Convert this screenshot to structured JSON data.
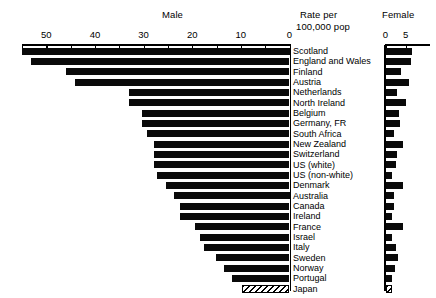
{
  "header": {
    "male_title": "Male",
    "rate_line1": "Rate per",
    "rate_line2": "100,000 pop",
    "female_title": "Female"
  },
  "axes": {
    "male": {
      "ticks": [
        55,
        50,
        45,
        40,
        35,
        30,
        25,
        20,
        15,
        10,
        5,
        0
      ],
      "labels": [
        {
          "v": 50,
          "t": "50"
        },
        {
          "v": 40,
          "t": "40"
        },
        {
          "v": 30,
          "t": "30"
        },
        {
          "v": 20,
          "t": "20"
        },
        {
          "v": 10,
          "t": "10"
        },
        {
          "v": 0,
          "t": "0"
        }
      ],
      "min": 0,
      "max": 55,
      "direction": "right-to-left"
    },
    "female": {
      "ticks": [
        0,
        5
      ],
      "labels": [
        {
          "v": 0,
          "t": "0"
        },
        {
          "v": 5,
          "t": "5"
        }
      ],
      "min": 0,
      "max": 11,
      "direction": "left-to-right"
    }
  },
  "chart_data": {
    "type": "bar",
    "title": "Male",
    "subtitle": "Rate per 100,000 pop",
    "xlabel": "Rate per 100,000 pop",
    "ylabel": "",
    "orientation": "horizontal",
    "grid": false,
    "legend": "none",
    "categories": [
      "Scotland",
      "England and Wales",
      "Finland",
      "Austria",
      "Netherlands",
      "North Ireland",
      "Belgium",
      "Germany, FR",
      "South Africa",
      "New Zealand",
      "Switzerland",
      "US (white)",
      "US (non-white)",
      "Denmark",
      "Australia",
      "Canada",
      "Ireland",
      "France",
      "Israel",
      "Italy",
      "Sweden",
      "Norway",
      "Portugal",
      "Japan"
    ],
    "series": [
      {
        "name": "Male",
        "xlim": [
          0,
          55
        ],
        "values": [
          55.0,
          53.1,
          46.0,
          44.2,
          32.9,
          32.9,
          30.4,
          30.4,
          29.2,
          27.9,
          27.9,
          27.9,
          27.2,
          25.4,
          23.8,
          22.6,
          22.6,
          19.5,
          18.5,
          17.5,
          15.1,
          13.5,
          11.8,
          9.8
        ]
      },
      {
        "name": "Female",
        "xlim": [
          0,
          11
        ],
        "values": [
          6.6,
          6.4,
          3.9,
          5.9,
          2.9,
          5.1,
          3.4,
          3.6,
          2.2,
          4.4,
          2.9,
          2.7,
          1.7,
          4.2,
          2.2,
          2.2,
          1.7,
          4.4,
          1.5,
          2.7,
          3.1,
          2.4,
          1.7,
          1.5
        ]
      }
    ],
    "special_marks": [
      {
        "category": "Japan",
        "style": "hatched"
      }
    ]
  }
}
